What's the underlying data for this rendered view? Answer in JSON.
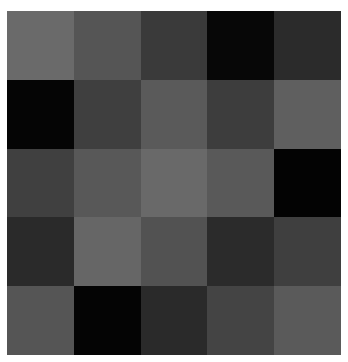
{
  "grid": {
    "rows": 5,
    "cols": 5,
    "cells": [
      [
        "#6a6a6a",
        "#555555",
        "#3a3a3a",
        "#070707",
        "#2b2b2b"
      ],
      [
        "#050505",
        "#3f3f3f",
        "#5a5a5a",
        "#3d3d3d",
        "#5f5f5f"
      ],
      [
        "#404040",
        "#585858",
        "#696969",
        "#595959",
        "#030303"
      ],
      [
        "#2a2a2a",
        "#666666",
        "#525252",
        "#2b2b2b",
        "#3f3f3f"
      ],
      [
        "#555555",
        "#040404",
        "#2a2a2a",
        "#444444",
        "#5a5a5a"
      ]
    ]
  }
}
